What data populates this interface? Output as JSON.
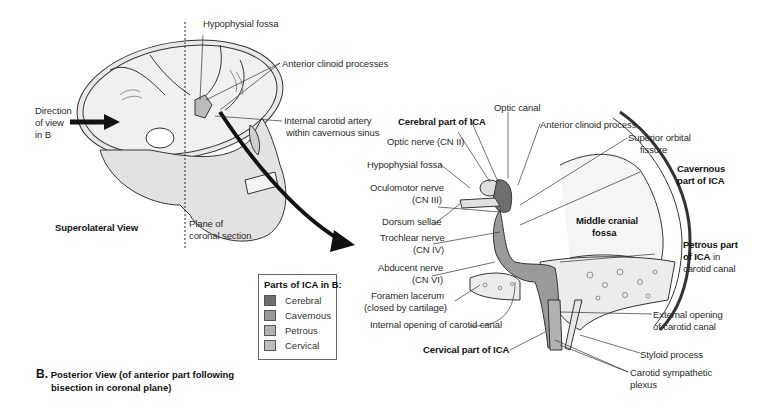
{
  "figure": {
    "panel_a": {
      "view_label": "Superolateral View",
      "labels": {
        "hypophysial_fossa": "Hypophysial fossa",
        "anterior_clinoid_processes": "Anterior clinoid processes",
        "direction_of_view": [
          "Direction",
          "of view",
          "in B"
        ],
        "ica_cavernous_sinus": [
          "Internal carotid artery",
          "within cavernous sinus"
        ],
        "plane_of_section": [
          "Plane of",
          "coronal section"
        ]
      }
    },
    "panel_b": {
      "caption_letter": "B.",
      "caption_lines": [
        "Posterior View (of anterior part following",
        "bisection in coronal plane)"
      ],
      "labels": {
        "optic_canal": "Optic canal",
        "cerebral_part_ica": "Cerebral part of ICA",
        "anterior_clinoid_process": "Anterior clinoid process",
        "optic_nerve": "Optic nerve (CN II)",
        "superior_orbital_fissure": [
          "Superior orbital",
          "fissure"
        ],
        "hypophysial_fossa": "Hypophysial fossa",
        "cavernous_part_ica": [
          "Cavernous",
          "part of ICA"
        ],
        "oculomotor_nerve": [
          "Oculomotor nerve",
          "(CN III)"
        ],
        "dorsum_sellae": "Dorsum sellae",
        "middle_cranial_fossa": [
          "Middle cranial",
          "fossa"
        ],
        "trochlear_nerve": [
          "Trochlear nerve",
          "(CN IV)"
        ],
        "petrous_part_ica": [
          "Petrous part",
          "of ICA",
          "in",
          "carotid canal"
        ],
        "abducent_nerve": [
          "Abducent nerve",
          "(CN VI)"
        ],
        "foramen_lacerum": [
          "Foramen lacerum",
          "(closed by cartilage)"
        ],
        "internal_opening": "Internal opening of carotid canal",
        "external_opening": [
          "External opening",
          "of carotid canal"
        ],
        "cervical_part_ica": "Cervical part of ICA",
        "styloid_process": "Styloid process",
        "carotid_sympathetic_plexus": [
          "Carotid sympathetic",
          "plexus"
        ]
      }
    },
    "legend": {
      "title": "Parts of ICA in B:",
      "items": [
        {
          "label": "Cerebral",
          "color": "#6e6e6e"
        },
        {
          "label": "Cavernous",
          "color": "#9a9a9a"
        },
        {
          "label": "Petrous",
          "color": "#b0b0b0"
        },
        {
          "label": "Cervical",
          "color": "#bdbdbd"
        }
      ]
    }
  }
}
